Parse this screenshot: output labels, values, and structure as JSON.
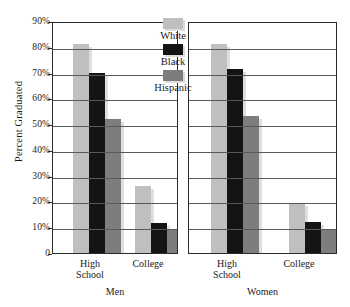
{
  "chart_data": {
    "type": "bar",
    "title": "",
    "xlabel": "",
    "ylabel": "Percent Graduated",
    "ylim": [
      0,
      90
    ],
    "ytick_labels": [
      "90%",
      "80%",
      "70%",
      "60%",
      "50%",
      "40%",
      "30%",
      "20%",
      "10%",
      "0"
    ],
    "ytick_values": [
      90,
      80,
      70,
      60,
      50,
      40,
      30,
      20,
      10,
      0
    ],
    "grid": true,
    "legend_position": "inside-top-center",
    "legend": [
      "White",
      "Black",
      "Hispanic"
    ],
    "series": [
      {
        "name": "White",
        "color": "#bfbfbf",
        "values": [
          81,
          26,
          81,
          19.5
        ]
      },
      {
        "name": "Black",
        "color": "#141414",
        "values": [
          70,
          11.5,
          71.5,
          12
        ]
      },
      {
        "name": "Hispanic",
        "color": "#7d7d7d",
        "values": [
          52,
          9.5,
          53,
          9
        ]
      }
    ],
    "categories": [
      "High School",
      "College",
      "High School",
      "College"
    ],
    "panels": [
      {
        "title": "Men",
        "categories": [
          {
            "line1": "High",
            "line2": "School"
          },
          {
            "line1": "College",
            "line2": ""
          }
        ],
        "groups": [
          {
            "category": "High School",
            "White": 81,
            "Black": 70,
            "Hispanic": 52
          },
          {
            "category": "College",
            "White": 26,
            "Black": 11.5,
            "Hispanic": 9.5
          }
        ]
      },
      {
        "title": "Women",
        "categories": [
          {
            "line1": "High",
            "line2": "School"
          },
          {
            "line1": "College",
            "line2": ""
          }
        ],
        "groups": [
          {
            "category": "High School",
            "White": 81,
            "Black": 71.5,
            "Hispanic": 53
          },
          {
            "category": "College",
            "White": 19.5,
            "Black": 12,
            "Hispanic": 9
          }
        ]
      }
    ]
  },
  "axis": {
    "y_title": "Percent Graduated",
    "ticks": [
      "90%",
      "80%",
      "70%",
      "60%",
      "50%",
      "40%",
      "30%",
      "20%",
      "10%",
      "0"
    ]
  },
  "legend": {
    "items": [
      {
        "label": "White",
        "key": "white"
      },
      {
        "label": "Black",
        "key": "black"
      },
      {
        "label": "Hispanic",
        "key": "hisp"
      }
    ]
  },
  "panels": {
    "men": {
      "title": "Men",
      "cat1_line1": "High",
      "cat1_line2": "School",
      "cat2_line1": "College"
    },
    "women": {
      "title": "Women",
      "cat1_line1": "High",
      "cat1_line2": "School",
      "cat2_line1": "College"
    }
  },
  "colors": {
    "white_bar": "#bfbfbf",
    "black_bar": "#141414",
    "hispanic_bar": "#7d7d7d",
    "grid": "#59595c",
    "frame": "#2b2b2b"
  }
}
